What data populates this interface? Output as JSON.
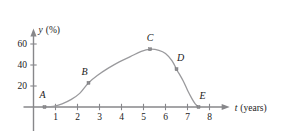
{
  "chart_data": {
    "type": "line",
    "title": "",
    "xlabel": "t (years)",
    "ylabel": "y (%)",
    "xlabel_variable": "t",
    "xlabel_unit": "(years)",
    "ylabel_variable": "y",
    "ylabel_unit": "(%)",
    "xlim": [
      0,
      8.6
    ],
    "ylim": [
      0,
      68
    ],
    "xticks": [
      1,
      2,
      3,
      4,
      5,
      6,
      7,
      8
    ],
    "xticklabels": [
      "1",
      "2",
      "3",
      "4",
      "5",
      "6",
      "7",
      "8"
    ],
    "yticks": [
      20,
      40,
      60
    ],
    "yticklabels": [
      "20",
      "40",
      "60"
    ],
    "grid": false,
    "legend": false,
    "curve_color": "#9a9a9d",
    "axis_color": "#87878a",
    "marker_color": "#8d8d90",
    "curve_points": [
      {
        "x": 0.5,
        "y": 0
      },
      {
        "x": 0.9,
        "y": 0.6
      },
      {
        "x": 1.3,
        "y": 3
      },
      {
        "x": 1.7,
        "y": 7
      },
      {
        "x": 2.1,
        "y": 13
      },
      {
        "x": 2.5,
        "y": 23
      },
      {
        "x": 2.9,
        "y": 30
      },
      {
        "x": 3.4,
        "y": 37
      },
      {
        "x": 3.9,
        "y": 43
      },
      {
        "x": 4.4,
        "y": 48
      },
      {
        "x": 4.9,
        "y": 53
      },
      {
        "x": 5.3,
        "y": 55
      },
      {
        "x": 5.7,
        "y": 54
      },
      {
        "x": 6.0,
        "y": 51
      },
      {
        "x": 6.3,
        "y": 44
      },
      {
        "x": 6.5,
        "y": 36
      },
      {
        "x": 6.8,
        "y": 25
      },
      {
        "x": 7.0,
        "y": 16
      },
      {
        "x": 7.2,
        "y": 8
      },
      {
        "x": 7.35,
        "y": 3
      },
      {
        "x": 7.5,
        "y": 0
      }
    ],
    "labeled_points": [
      {
        "name": "A",
        "x": 0.5,
        "y": 0,
        "label_dx": -2,
        "label_dy": -9
      },
      {
        "name": "B",
        "x": 2.5,
        "y": 23,
        "label_dx": -4,
        "label_dy": -8
      },
      {
        "name": "C",
        "x": 5.3,
        "y": 55,
        "label_dx": 0,
        "label_dy": -8
      },
      {
        "name": "D",
        "x": 6.5,
        "y": 36,
        "label_dx": 4,
        "label_dy": -8
      },
      {
        "name": "E",
        "x": 7.5,
        "y": 0,
        "label_dx": 4,
        "label_dy": -8
      }
    ]
  },
  "figure": {
    "caption": ""
  }
}
